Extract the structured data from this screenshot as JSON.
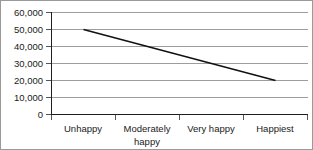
{
  "chart_data": {
    "type": "line",
    "title": "",
    "xlabel": "",
    "ylabel": "",
    "categories": [
      "Unhappy",
      "Moderately happy",
      "Very happy",
      "Happiest"
    ],
    "series": [
      {
        "name": "Income",
        "values": [
          50000,
          40000,
          30000,
          20000
        ]
      }
    ],
    "ylim": [
      0,
      60000
    ],
    "yticks": [
      0,
      10000,
      20000,
      30000,
      40000,
      50000,
      60000
    ],
    "ytick_labels": [
      "0",
      "10,000",
      "20,000",
      "30,000",
      "40,000",
      "50,000",
      "60,000"
    ],
    "grid": true,
    "grid_axis": "y",
    "legend": false,
    "legend_position": "none",
    "line_color": "#111111",
    "grid_color": "#9d9d9d",
    "axis_color": "#1f1f1f",
    "background_color": "#ffffff"
  },
  "axis": {
    "y_labels": {
      "t0": "0",
      "t1": "10,000",
      "t2": "20,000",
      "t3": "30,000",
      "t4": "40,000",
      "t5": "50,000",
      "t6": "60,000"
    },
    "x_labels": {
      "c0": "Unhappy",
      "c1_line1": "Moderately",
      "c1_line2": "happy",
      "c2": "Very happy",
      "c3": "Happiest"
    }
  }
}
